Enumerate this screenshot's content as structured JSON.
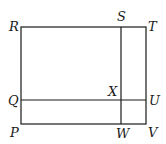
{
  "diagram": {
    "type": "geometry-rectangle",
    "outer_rectangle": {
      "vertices": [
        "R",
        "T",
        "V",
        "P"
      ]
    },
    "segments": [
      {
        "from": "S",
        "to": "W",
        "label": "vertical segment SW"
      },
      {
        "from": "Q",
        "to": "U",
        "label": "horizontal segment QU"
      }
    ],
    "intersection": "X",
    "points": {
      "R": {
        "label": "R",
        "x": 21,
        "y": 27
      },
      "S": {
        "label": "S",
        "x": 121,
        "y": 27
      },
      "T": {
        "label": "T",
        "x": 146,
        "y": 27
      },
      "Q": {
        "label": "Q",
        "x": 21,
        "y": 100
      },
      "X": {
        "label": "X",
        "x": 121,
        "y": 100
      },
      "U": {
        "label": "U",
        "x": 146,
        "y": 100
      },
      "P": {
        "label": "P",
        "x": 21,
        "y": 124
      },
      "W": {
        "label": "W",
        "x": 121,
        "y": 124
      },
      "V": {
        "label": "V",
        "x": 146,
        "y": 124
      }
    }
  }
}
